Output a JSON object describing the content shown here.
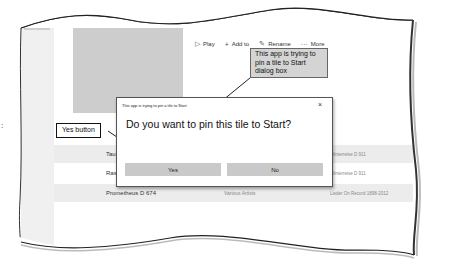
{
  "playlist": {
    "meta": "1 song in playlist • 7 min 59 sec"
  },
  "toolbar": {
    "play": {
      "label": "Play",
      "icon": "play-icon"
    },
    "add_to": {
      "label": "Add to",
      "icon": "plus-icon"
    },
    "rename": {
      "label": "Rename",
      "icon": "pencil-icon"
    },
    "more": {
      "label": "More",
      "icon": "ellipsis-icon"
    }
  },
  "tracks": [
    {
      "title": "Tauschung",
      "artist": "",
      "album": "Winterreise D 911"
    },
    {
      "title": "Rast",
      "artist": "",
      "album": "Winterreise D 911"
    },
    {
      "title": "Prometheus D 674",
      "artist": "Various Artists",
      "album": "Lieder On Record 1898-2012"
    }
  ],
  "dialog": {
    "title": "This app is trying to pin a tile to Start",
    "close": "×",
    "question": "Do you want to pin this tile to Start?",
    "yes": "Yes",
    "no": "No"
  },
  "callouts": {
    "pin_dialog": "This app is trying to pin a tile to Start dialog box",
    "yes_button": "Yes button"
  },
  "side_mark": ":"
}
